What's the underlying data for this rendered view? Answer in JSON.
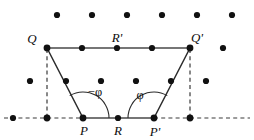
{
  "figure": {
    "background_color": "#ffffff",
    "width": 254,
    "height": 140,
    "colors": {
      "dot": "#111111",
      "solid_edge": "#4a4a4a",
      "leg_edge": "#2b2b2b",
      "dashed": "#3a3a3a",
      "text": "#0d0d0d"
    },
    "lattice": {
      "description": "regular dot lattice, 6 columns by 4 rows, staggered",
      "rows": [
        {
          "y": 15,
          "xs": [
            57,
            92,
            127,
            162,
            197,
            232
          ]
        },
        {
          "y": 48,
          "xs": [
            47,
            82,
            117,
            152,
            190,
            223
          ]
        },
        {
          "y": 81,
          "xs": [
            30,
            66,
            101,
            136,
            171,
            206
          ]
        },
        {
          "y": 118,
          "xs": [
            13,
            48,
            83,
            118,
            154,
            190
          ]
        }
      ]
    },
    "vertices": [
      {
        "id": "Q",
        "label": "Q",
        "x": 47,
        "y": 48,
        "label_x": 32,
        "label_y": 42
      },
      {
        "id": "Rp",
        "label": "R'",
        "x": 117,
        "y": 48,
        "label_x": 112,
        "label_y": 42
      },
      {
        "id": "Qp",
        "label": "Q'",
        "x": 190,
        "y": 48,
        "label_x": 189,
        "label_y": 42
      },
      {
        "id": "P",
        "label": "P",
        "x": 83,
        "y": 118,
        "label_x": 79,
        "label_y": 134
      },
      {
        "id": "R",
        "label": "R",
        "x": 118,
        "y": 118,
        "label_x": 113,
        "label_y": 134
      },
      {
        "id": "Pp",
        "label": "P'",
        "x": 154,
        "y": 118,
        "label_x": 148,
        "label_y": 135
      }
    ],
    "edges": {
      "top_solid": {
        "from": "Q",
        "to": "Qp"
      },
      "bottom_solid": {
        "from": "P",
        "to": "Pp"
      },
      "left_leg": {
        "from": "Q",
        "to": "P"
      },
      "right_leg": {
        "from": "Qp",
        "to": "Pp"
      }
    },
    "dashed_guides": [
      {
        "name": "left-vertical-dashed",
        "x1": 47,
        "y1": 48,
        "x2": 47,
        "y2": 118
      },
      {
        "name": "right-vertical-dashed",
        "x1": 190,
        "y1": 48,
        "x2": 190,
        "y2": 118
      },
      {
        "name": "baseline-dashed-left",
        "x1": 4,
        "y1": 118,
        "x2": 83,
        "y2": 118
      },
      {
        "name": "baseline-dashed-right",
        "x1": 154,
        "y1": 118,
        "x2": 250,
        "y2": 118
      }
    ],
    "angles": [
      {
        "id": "angle-minus-phi",
        "label": "−φ",
        "vertex": "P",
        "radius": 26,
        "label_x": 88,
        "label_y": 95,
        "description": "interior angle at P between ray PQ and baseline to the right"
      },
      {
        "id": "angle-phi",
        "label": "φ",
        "vertex": "Pp",
        "radius": 26,
        "label_x": 136,
        "label_y": 99,
        "description": "interior angle at P-prime between baseline to the left and ray P'Q'"
      }
    ]
  }
}
